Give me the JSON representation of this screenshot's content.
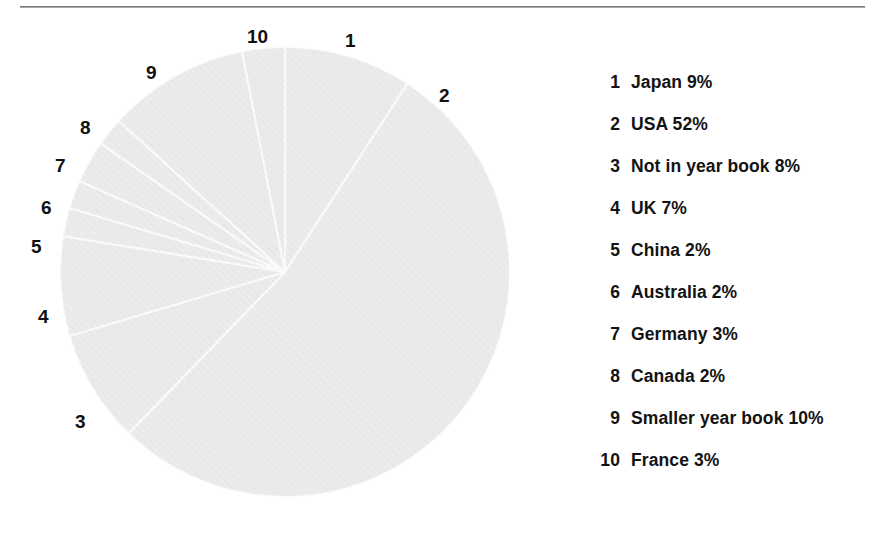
{
  "colors": {
    "slice_fill": "#e9e9e9",
    "slice_separator": "#ffffff",
    "text": "#131313",
    "rule": "#7c7c7c",
    "background": "#ffffff"
  },
  "divider": {
    "name": "top-horizontal-rule"
  },
  "chart_data": {
    "type": "pie",
    "title": "",
    "start_angle_deg": 0,
    "direction": "clockwise",
    "units": "%",
    "labels_on_chart": true,
    "legend_position": "right",
    "categories": [
      "Japan",
      "USA",
      "Not in year book",
      "UK",
      "China",
      "Australia",
      "Germany",
      "Canada",
      "Smaller year book",
      "France"
    ],
    "values": [
      9,
      52,
      8,
      7,
      2,
      2,
      3,
      2,
      10,
      3
    ],
    "slice_keys": [
      "1",
      "2",
      "3",
      "4",
      "5",
      "6",
      "7",
      "8",
      "9",
      "10"
    ],
    "total": 98
  },
  "pie": {
    "center_x": 285,
    "center_y": 272,
    "radius": 225,
    "callouts": [
      {
        "key": "1",
        "x": 345,
        "y": 31
      },
      {
        "key": "2",
        "x": 439,
        "y": 86
      },
      {
        "key": "3",
        "x": 75,
        "y": 412
      },
      {
        "key": "4",
        "x": 38,
        "y": 307
      },
      {
        "key": "5",
        "x": 31,
        "y": 237
      },
      {
        "key": "6",
        "x": 41,
        "y": 198
      },
      {
        "key": "7",
        "x": 55,
        "y": 156
      },
      {
        "key": "8",
        "x": 80,
        "y": 118
      },
      {
        "key": "9",
        "x": 146,
        "y": 63
      },
      {
        "key": "10",
        "x": 247,
        "y": 27
      }
    ]
  },
  "legend": {
    "name": "pie-legend",
    "items": [
      {
        "num": "1",
        "label": "Japan 9%"
      },
      {
        "num": "2",
        "label": "USA 52%"
      },
      {
        "num": "3",
        "label": "Not in year book 8%"
      },
      {
        "num": "4",
        "label": "UK 7%"
      },
      {
        "num": "5",
        "label": "China 2%"
      },
      {
        "num": "6",
        "label": "Australia 2%"
      },
      {
        "num": "7",
        "label": "Germany 3%"
      },
      {
        "num": "8",
        "label": "Canada 2%"
      },
      {
        "num": "9",
        "label": "Smaller year book 10%"
      },
      {
        "num": "10",
        "label": "France 3%"
      }
    ]
  }
}
